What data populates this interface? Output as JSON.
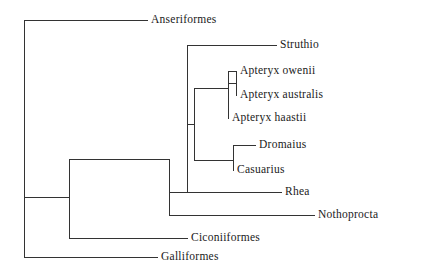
{
  "figure": {
    "type": "phylogenetic-cladogram",
    "orientation": "left-to-right",
    "background_color": "#ffffff",
    "line_color": "#333333",
    "text_color": "#1a1a1a"
  },
  "tips": [
    {
      "id": "anseriformes",
      "label": "Anseriformes",
      "y": 20,
      "branch_start_x": 24,
      "branch_end_x": 148,
      "label_x": 151
    },
    {
      "id": "struthio",
      "label": "Struthio",
      "y": 45,
      "branch_start_x": 187,
      "branch_end_x": 277,
      "label_x": 280
    },
    {
      "id": "apteryx-owenii",
      "label": "Apteryx owenii",
      "y": 71,
      "branch_start_x": 228,
      "branch_end_x": 237,
      "label_x": 240
    },
    {
      "id": "apteryx-australis",
      "label": "Apteryx australis",
      "y": 95,
      "branch_start_x": 236,
      "branch_end_x": 237,
      "label_x": 240
    },
    {
      "id": "apteryx-haastii",
      "label": "Apteryx haastii",
      "y": 118,
      "branch_start_x": 228,
      "branch_end_x": 229,
      "label_x": 232
    },
    {
      "id": "dromaius",
      "label": "Dromaius",
      "y": 145,
      "branch_start_x": 233,
      "branch_end_x": 256,
      "label_x": 259
    },
    {
      "id": "casuarius",
      "label": "Casuarius",
      "y": 170,
      "branch_start_x": 233,
      "branch_end_x": 234,
      "label_x": 237
    },
    {
      "id": "rhea",
      "label": "Rhea",
      "y": 192,
      "branch_start_x": 187,
      "branch_end_x": 282,
      "label_x": 285
    },
    {
      "id": "nothoprocta",
      "label": "Nothoprocta",
      "y": 215,
      "branch_start_x": 169,
      "branch_end_x": 315,
      "label_x": 318
    },
    {
      "id": "ciconiiformes",
      "label": "Ciconiiformes",
      "y": 238,
      "branch_start_x": 69,
      "branch_end_x": 188,
      "label_x": 191
    },
    {
      "id": "galliformes",
      "label": "Galliformes",
      "y": 257,
      "branch_start_x": 24,
      "branch_end_x": 158,
      "label_x": 161
    }
  ],
  "internal_nodes": [
    {
      "id": "root",
      "x": 24,
      "y_top": 20,
      "y_bottom": 257,
      "parent_x": null,
      "parent_y": null
    },
    {
      "id": "neognath-split",
      "x": 69,
      "y_top": 159,
      "y_bottom": 238,
      "parent_x": 24,
      "parent_y": 197
    },
    {
      "id": "palaeognath",
      "x": 169,
      "y_top": 159,
      "y_bottom": 215,
      "parent_x": 69,
      "parent_y": 159
    },
    {
      "id": "ratite",
      "x": 187,
      "y_top": 45,
      "y_bottom": 192,
      "parent_x": 169,
      "parent_y": 192
    },
    {
      "id": "kiwi-emu-clade",
      "x": 194,
      "y_top": 88,
      "y_bottom": 160,
      "parent_x": 187,
      "parent_y": 124
    },
    {
      "id": "apteryx-clade",
      "x": 228,
      "y_top": 71,
      "y_bottom": 118,
      "parent_x": 194,
      "parent_y": 88
    },
    {
      "id": "apteryx-pair",
      "x": 236,
      "y_top": 71,
      "y_bottom": 95,
      "parent_x": 228,
      "parent_y": 83
    },
    {
      "id": "casuariiformes",
      "x": 233,
      "y_top": 145,
      "y_bottom": 170,
      "parent_x": 194,
      "parent_y": 160
    }
  ]
}
